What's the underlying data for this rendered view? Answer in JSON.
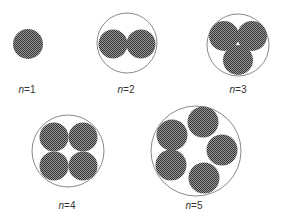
{
  "figure": {
    "colors": {
      "fill_dark": "#3a3a3a",
      "fill_light": "#9a9a9a",
      "outline": "#8a8a8a",
      "label": "#333333"
    },
    "panels": [
      {
        "n": 1,
        "label_var": "n",
        "label_eq": "=",
        "label_val": "1",
        "label_x": 27,
        "label_y": 84,
        "outer": null,
        "inner": [
          {
            "cx": 28,
            "cy": 44,
            "r": 15
          }
        ]
      },
      {
        "n": 2,
        "label_var": "n",
        "label_eq": "=",
        "label_val": "2",
        "label_x": 126,
        "label_y": 84,
        "outer": {
          "cx": 127,
          "cy": 43,
          "r": 30
        },
        "inner": [
          {
            "cx": 113,
            "cy": 44,
            "r": 14.5
          },
          {
            "cx": 141,
            "cy": 44,
            "r": 14.5
          }
        ]
      },
      {
        "n": 3,
        "label_var": "n",
        "label_eq": "=",
        "label_val": "3",
        "label_x": 238,
        "label_y": 84,
        "outer": {
          "cx": 238,
          "cy": 45,
          "r": 31
        },
        "inner": [
          {
            "cx": 224,
            "cy": 36,
            "r": 15
          },
          {
            "cx": 252,
            "cy": 36,
            "r": 15
          },
          {
            "cx": 238,
            "cy": 60,
            "r": 15
          }
        ]
      },
      {
        "n": 4,
        "label_var": "n",
        "label_eq": "=",
        "label_val": "4",
        "label_x": 67,
        "label_y": 200,
        "outer": {
          "cx": 68,
          "cy": 151,
          "r": 36
        },
        "inner": [
          {
            "cx": 54,
            "cy": 137,
            "r": 14.5
          },
          {
            "cx": 83,
            "cy": 137,
            "r": 14.5
          },
          {
            "cx": 54,
            "cy": 166,
            "r": 14.5
          },
          {
            "cx": 83,
            "cy": 166,
            "r": 14.5
          }
        ]
      },
      {
        "n": 5,
        "label_var": "n",
        "label_eq": "=",
        "label_val": "5",
        "label_x": 194,
        "label_y": 200,
        "outer": {
          "cx": 196,
          "cy": 151,
          "r": 45
        },
        "inner": [
          {
            "cx": 172,
            "cy": 135,
            "r": 15.5
          },
          {
            "cx": 203,
            "cy": 122,
            "r": 15.5
          },
          {
            "cx": 222,
            "cy": 150,
            "r": 15.5
          },
          {
            "cx": 204,
            "cy": 178,
            "r": 15.5
          },
          {
            "cx": 171,
            "cy": 165,
            "r": 15.5
          }
        ]
      }
    ]
  }
}
